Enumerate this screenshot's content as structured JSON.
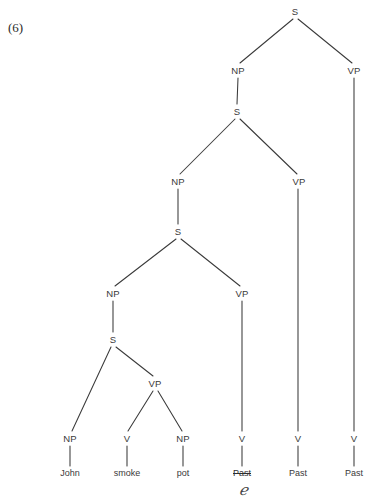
{
  "figure": {
    "example_number": "(6)",
    "type": "syntactic-tree-diagram"
  },
  "colors": {
    "background": "#ffffff",
    "line": "#3a3a3a",
    "text": "#3a3a3a",
    "ink_annotation": "#454545"
  },
  "tree": {
    "nodes": [
      {
        "id": "S1",
        "label": "S",
        "x": 295,
        "y": 11,
        "level": 0
      },
      {
        "id": "NP1",
        "label": "NP",
        "x": 238,
        "y": 70,
        "level": 1
      },
      {
        "id": "VP1",
        "label": "VP",
        "x": 354,
        "y": 70,
        "level": 1
      },
      {
        "id": "S2",
        "label": "S",
        "x": 237,
        "y": 111,
        "level": 2
      },
      {
        "id": "NP2",
        "label": "NP",
        "x": 178,
        "y": 181,
        "level": 3
      },
      {
        "id": "VP2",
        "label": "VP",
        "x": 299,
        "y": 181,
        "level": 3
      },
      {
        "id": "S3",
        "label": "S",
        "x": 178,
        "y": 231,
        "level": 4
      },
      {
        "id": "NP3",
        "label": "NP",
        "x": 113,
        "y": 293,
        "level": 5
      },
      {
        "id": "VP3",
        "label": "VP",
        "x": 242,
        "y": 293,
        "level": 5
      },
      {
        "id": "S4",
        "label": "S",
        "x": 113,
        "y": 339,
        "level": 6
      },
      {
        "id": "VP4",
        "label": "VP",
        "x": 155,
        "y": 383,
        "level": 7
      },
      {
        "id": "NP4",
        "label": "NP",
        "x": 70,
        "y": 438,
        "level": 8
      },
      {
        "id": "V1",
        "label": "V",
        "x": 127,
        "y": 438,
        "level": 8
      },
      {
        "id": "NP5",
        "label": "NP",
        "x": 183,
        "y": 438,
        "level": 8
      },
      {
        "id": "V2",
        "label": "V",
        "x": 242,
        "y": 438,
        "level": 8
      },
      {
        "id": "V3",
        "label": "V",
        "x": 298,
        "y": 438,
        "level": 8
      },
      {
        "id": "V4",
        "label": "V",
        "x": 354,
        "y": 438,
        "level": 8
      }
    ],
    "terminals": [
      {
        "id": "T1",
        "label": "John",
        "x": 70,
        "y": 473,
        "struck": false
      },
      {
        "id": "T2",
        "label": "smoke",
        "x": 127,
        "y": 473,
        "struck": false
      },
      {
        "id": "T3",
        "label": "pot",
        "x": 183,
        "y": 473,
        "struck": false
      },
      {
        "id": "T4",
        "label": "Past",
        "x": 242,
        "y": 473,
        "struck": true
      },
      {
        "id": "T5",
        "label": "Past",
        "x": 298,
        "y": 473,
        "struck": false
      },
      {
        "id": "T6",
        "label": "Past",
        "x": 354,
        "y": 473,
        "struck": false
      }
    ],
    "annotations": [
      {
        "id": "A1",
        "label": "be",
        "glyph": "ℯ",
        "x": 243,
        "y": 490,
        "kind": "handwritten-correction"
      }
    ],
    "edges": [
      {
        "from": "S1",
        "to": "NP1",
        "x1": 293,
        "y1": 19,
        "x2": 240,
        "y2": 63
      },
      {
        "from": "S1",
        "to": "VP1",
        "x1": 298,
        "y1": 19,
        "x2": 352,
        "y2": 63
      },
      {
        "from": "NP1",
        "to": "S2",
        "x1": 238,
        "y1": 78,
        "x2": 237,
        "y2": 104
      },
      {
        "from": "S2",
        "to": "NP2",
        "x1": 235,
        "y1": 119,
        "x2": 180,
        "y2": 174
      },
      {
        "from": "S2",
        "to": "VP2",
        "x1": 240,
        "y1": 119,
        "x2": 297,
        "y2": 174
      },
      {
        "from": "NP2",
        "to": "S3",
        "x1": 178,
        "y1": 189,
        "x2": 178,
        "y2": 224
      },
      {
        "from": "S3",
        "to": "NP3",
        "x1": 176,
        "y1": 239,
        "x2": 115,
        "y2": 286
      },
      {
        "from": "S3",
        "to": "VP3",
        "x1": 181,
        "y1": 239,
        "x2": 240,
        "y2": 286
      },
      {
        "from": "NP3",
        "to": "S4",
        "x1": 113,
        "y1": 301,
        "x2": 113,
        "y2": 332
      },
      {
        "from": "S4",
        "to": "NP4",
        "x1": 111,
        "y1": 347,
        "x2": 72,
        "y2": 431
      },
      {
        "from": "S4",
        "to": "VP4",
        "x1": 116,
        "y1": 347,
        "x2": 153,
        "y2": 376
      },
      {
        "from": "VP4",
        "to": "V1",
        "x1": 153,
        "y1": 391,
        "x2": 128,
        "y2": 431
      },
      {
        "from": "VP4",
        "to": "NP5",
        "x1": 158,
        "y1": 391,
        "x2": 182,
        "y2": 431
      },
      {
        "from": "VP3",
        "to": "V2",
        "x1": 242,
        "y1": 301,
        "x2": 242,
        "y2": 431
      },
      {
        "from": "VP2",
        "to": "V3",
        "x1": 298,
        "y1": 189,
        "x2": 298,
        "y2": 431
      },
      {
        "from": "VP1",
        "to": "V4",
        "x1": 354,
        "y1": 78,
        "x2": 354,
        "y2": 431
      },
      {
        "from": "NP4",
        "to": "T1",
        "x1": 70,
        "y1": 446,
        "x2": 70,
        "y2": 466
      },
      {
        "from": "V1",
        "to": "T2",
        "x1": 127,
        "y1": 446,
        "x2": 127,
        "y2": 466
      },
      {
        "from": "NP5",
        "to": "T3",
        "x1": 183,
        "y1": 446,
        "x2": 183,
        "y2": 466
      },
      {
        "from": "V2",
        "to": "T4",
        "x1": 242,
        "y1": 446,
        "x2": 242,
        "y2": 466
      },
      {
        "from": "V3",
        "to": "T5",
        "x1": 298,
        "y1": 446,
        "x2": 298,
        "y2": 466
      },
      {
        "from": "V4",
        "to": "T6",
        "x1": 354,
        "y1": 446,
        "x2": 354,
        "y2": 466
      }
    ]
  }
}
